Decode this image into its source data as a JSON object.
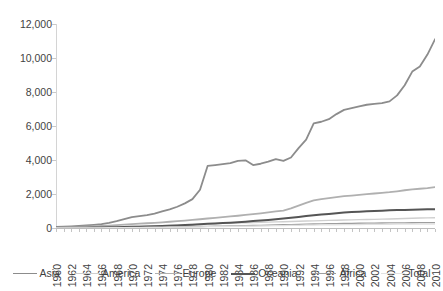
{
  "chart_data": {
    "type": "line",
    "title": "",
    "subtitle": "",
    "xlabel": "",
    "ylabel": "",
    "xlim": [
      1960,
      2010
    ],
    "ylim": [
      0,
      12000
    ],
    "grid": false,
    "legend_position": "bottom",
    "y_ticks": [
      0,
      2000,
      4000,
      6000,
      8000,
      10000,
      12000
    ],
    "y_tick_labels": [
      "0",
      "2,000",
      "4,000",
      "6,000",
      "8,000",
      "10,000",
      "12,000"
    ],
    "x": [
      1960,
      1961,
      1962,
      1963,
      1964,
      1965,
      1966,
      1967,
      1968,
      1969,
      1970,
      1971,
      1972,
      1973,
      1974,
      1975,
      1976,
      1977,
      1978,
      1979,
      1980,
      1981,
      1982,
      1983,
      1984,
      1985,
      1986,
      1987,
      1988,
      1989,
      1990,
      1991,
      1992,
      1993,
      1994,
      1995,
      1996,
      1997,
      1998,
      1999,
      2000,
      2001,
      2002,
      2003,
      2004,
      2005,
      2006,
      2007,
      2008,
      2009,
      2010
    ],
    "x_tick_labels": [
      "1960",
      "1962",
      "1964",
      "1966",
      "1968",
      "1970",
      "1972",
      "1974",
      "1976",
      "1978",
      "1980",
      "1982",
      "1984",
      "1986",
      "1988",
      "1990",
      "1992",
      "1994",
      "1996",
      "1998",
      "2000",
      "2002",
      "2004",
      "2006",
      "2008",
      "2010"
    ],
    "series": [
      {
        "name": "Asia",
        "color": "#8c8c8c",
        "width": 1.8,
        "values": [
          60,
          75,
          95,
          120,
          150,
          185,
          230,
          300,
          400,
          520,
          640,
          700,
          760,
          850,
          980,
          1100,
          1250,
          1450,
          1700,
          2250,
          3650,
          3700,
          3760,
          3820,
          3950,
          3980,
          3700,
          3780,
          3900,
          4050,
          3950,
          4150,
          4700,
          5200,
          6150,
          6250,
          6400,
          6700,
          6950,
          7050,
          7150,
          7250,
          7300,
          7350,
          7450,
          7800,
          8400,
          9200,
          9500,
          10200,
          11100
        ]
      },
      {
        "name": "America",
        "color": "#cfcfcf",
        "width": 1.4,
        "values": [
          20,
          24,
          28,
          33,
          38,
          45,
          52,
          60,
          70,
          82,
          95,
          105,
          115,
          128,
          142,
          158,
          175,
          192,
          210,
          230,
          250,
          262,
          275,
          288,
          300,
          312,
          324,
          336,
          348,
          360,
          372,
          385,
          398,
          410,
          422,
          434,
          446,
          458,
          470,
          480,
          490,
          500,
          510,
          520,
          530,
          545,
          560,
          572,
          584,
          594,
          605
        ]
      },
      {
        "name": "Europe",
        "color": "#b0b0b0",
        "width": 1.8,
        "values": [
          40,
          48,
          58,
          70,
          84,
          100,
          118,
          140,
          165,
          195,
          228,
          252,
          278,
          306,
          336,
          368,
          402,
          438,
          476,
          516,
          558,
          596,
          636,
          678,
          722,
          768,
          816,
          866,
          918,
          972,
          1028,
          1150,
          1320,
          1480,
          1620,
          1700,
          1760,
          1820,
          1870,
          1910,
          1950,
          1990,
          2030,
          2070,
          2110,
          2160,
          2220,
          2270,
          2310,
          2350,
          2400
        ]
      },
      {
        "name": "Oceania",
        "color": "#555555",
        "width": 2.0,
        "values": [
          8,
          10,
          13,
          16,
          20,
          25,
          31,
          38,
          46,
          56,
          68,
          78,
          90,
          103,
          118,
          134,
          152,
          172,
          194,
          218,
          244,
          266,
          290,
          316,
          344,
          374,
          406,
          440,
          476,
          514,
          554,
          600,
          650,
          700,
          745,
          790,
          830,
          870,
          905,
          935,
          962,
          985,
          1005,
          1022,
          1038,
          1052,
          1065,
          1078,
          1088,
          1096,
          1105
        ]
      },
      {
        "name": "Africa",
        "color": "#9e9e9e",
        "width": 1.3,
        "values": [
          5,
          6,
          7,
          9,
          11,
          13,
          16,
          19,
          23,
          27,
          32,
          36,
          41,
          46,
          52,
          58,
          65,
          72,
          80,
          88,
          97,
          104,
          112,
          120,
          129,
          138,
          148,
          158,
          169,
          180,
          192,
          202,
          213,
          224,
          235,
          244,
          252,
          260,
          267,
          273,
          279,
          284,
          289,
          293,
          297,
          301,
          305,
          308,
          311,
          313,
          316
        ]
      },
      {
        "name": "Total",
        "color": "#e2e2e2",
        "width": 1.3,
        "values": [
          4,
          5,
          6,
          7,
          8,
          10,
          12,
          14,
          17,
          20,
          24,
          27,
          31,
          35,
          40,
          45,
          50,
          56,
          62,
          68,
          75,
          80,
          86,
          92,
          98,
          105,
          112,
          119,
          127,
          135,
          143,
          150,
          158,
          166,
          174,
          180,
          186,
          192,
          197,
          202,
          206,
          210,
          214,
          217,
          220,
          223,
          226,
          228,
          230,
          232,
          234
        ]
      }
    ]
  },
  "legend": {
    "items": [
      {
        "label": "Asia"
      },
      {
        "label": "America"
      },
      {
        "label": "Europe"
      },
      {
        "label": "Oceania"
      },
      {
        "label": "Africa"
      },
      {
        "label": "Total"
      }
    ]
  }
}
